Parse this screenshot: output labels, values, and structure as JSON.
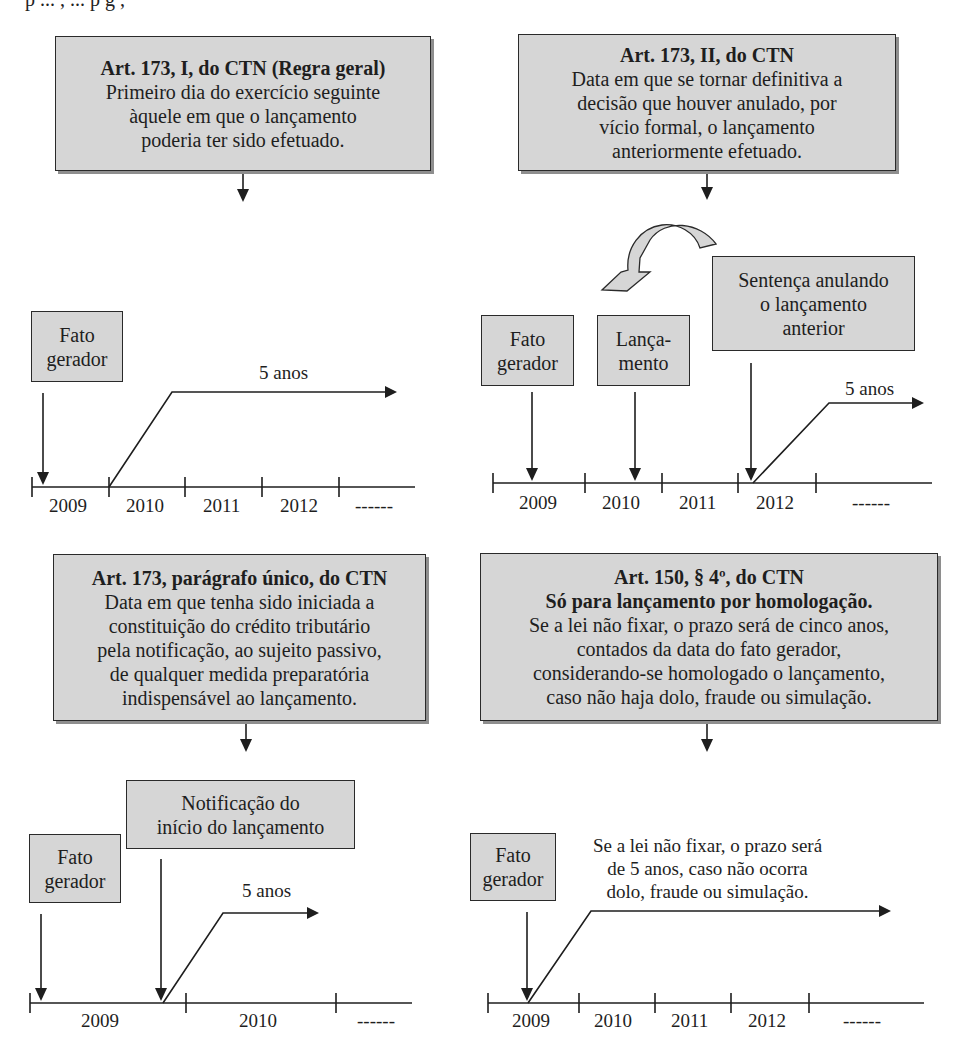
{
  "top_cut_text": "p   ...   ,   ...   p         g ,",
  "panels": [
    {
      "id": "art173-I",
      "header": {
        "title": "Art. 173, I, do CTN (Regra geral)",
        "lines": [
          "Primeiro dia do exercício seguinte",
          "àquele em que o lançamento",
          "poderia ter sido efetuado."
        ]
      },
      "events": [
        {
          "label_lines": [
            "Fato",
            "gerador"
          ]
        }
      ],
      "period_label": "5 anos",
      "years": [
        "2009",
        "2010",
        "2011",
        "2012",
        "------"
      ]
    },
    {
      "id": "art173-II",
      "header": {
        "title": "Art. 173, II, do CTN",
        "lines": [
          "Data em que se tornar definitiva a",
          "decisão que houver anulado, por",
          "vício formal, o lançamento",
          "anteriormente efetuado."
        ]
      },
      "events": [
        {
          "label_lines": [
            "Fato",
            "gerador"
          ]
        },
        {
          "label_lines": [
            "Lança-",
            "mento"
          ]
        },
        {
          "label_lines": [
            "Sentença anulando",
            "o lançamento",
            "anterior"
          ]
        }
      ],
      "period_label": "5 anos",
      "years": [
        "2009",
        "2010",
        "2011",
        "2012",
        "------"
      ]
    },
    {
      "id": "art173-paragrafo-unico",
      "header": {
        "title": "Art. 173, parágrafo único, do CTN",
        "lines": [
          "Data em que tenha sido iniciada a",
          "constituição do crédito tributário",
          "pela notificação, ao sujeito passivo,",
          "de qualquer medida preparatória",
          "indispensável ao lançamento."
        ]
      },
      "events": [
        {
          "label_lines": [
            "Fato",
            "gerador"
          ]
        },
        {
          "label_lines": [
            "Notificação do",
            "início do lançamento"
          ]
        }
      ],
      "period_label": "5 anos",
      "years": [
        "2009",
        "2010",
        "------"
      ]
    },
    {
      "id": "art150-par4",
      "header": {
        "title": "Art. 150, § 4º, do CTN",
        "subtitle": "Só para lançamento por homologação.",
        "lines": [
          "Se a lei não fixar, o prazo será de cinco anos,",
          "contados da data do fato gerador,",
          "considerando-se homologado o lançamento,",
          "caso não haja dolo, fraude ou simulação."
        ]
      },
      "events": [
        {
          "label_lines": [
            "Fato",
            "gerador"
          ]
        }
      ],
      "period_label_lines": [
        "Se a lei não fixar, o prazo será",
        "de 5 anos, caso não ocorra",
        "dolo, fraude ou simulação."
      ],
      "years": [
        "2009",
        "2010",
        "2011",
        "2012",
        "------"
      ]
    }
  ],
  "colors": {
    "box_fill": "#d6d6d6",
    "stroke": "#2a2a2a",
    "shadow": "#8e8e8e"
  }
}
